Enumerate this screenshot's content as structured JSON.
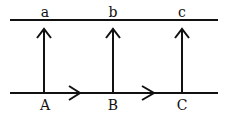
{
  "diagram": {
    "top_labels": [
      "a",
      "b",
      "c"
    ],
    "bottom_labels": [
      "A",
      "B",
      "C"
    ],
    "colors": {
      "stroke": "#111111",
      "background": "#ffffff"
    }
  }
}
